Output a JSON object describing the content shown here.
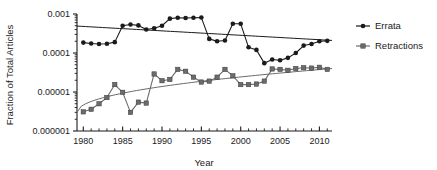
{
  "chart_data": {
    "type": "line",
    "title": "",
    "xlabel": "Year",
    "ylabel": "Fraction of Total Articles",
    "yscale": "log",
    "xlim": [
      1979.2,
      2011.6
    ],
    "ylim": [
      1e-06,
      0.001
    ],
    "grid": false,
    "legend_position": "right",
    "xticks": [
      1980,
      1985,
      1990,
      1995,
      2000,
      2005,
      2010
    ],
    "xtick_labels": [
      "1980",
      "1985",
      "1990",
      "1995",
      "2000",
      "2005",
      "2010"
    ],
    "xminor_tick_step": 1,
    "yticks": [
      0.001,
      0.0001,
      1e-05,
      1e-06
    ],
    "ytick_labels": [
      "0.001",
      "0.0001",
      "0.00001",
      "0.000001"
    ],
    "x": [
      1980,
      1981,
      1982,
      1983,
      1984,
      1985,
      1986,
      1987,
      1988,
      1989,
      1990,
      1991,
      1992,
      1993,
      1994,
      1995,
      1996,
      1997,
      1998,
      1999,
      2000,
      2001,
      2002,
      2003,
      2004,
      2005,
      2006,
      2007,
      2008,
      2009,
      2010,
      2011
    ],
    "series": [
      {
        "name": "Errata",
        "color": "#1a1a1a",
        "marker": "circle",
        "values": [
          0.000185,
          0.000175,
          0.00017,
          0.000172,
          0.00019,
          0.0005,
          0.00054,
          0.00051,
          0.0004,
          0.00043,
          0.0005,
          0.00076,
          0.0008,
          0.00079,
          0.0008,
          0.00081,
          0.00023,
          0.0002,
          0.00021,
          0.00056,
          0.00056,
          0.00014,
          0.00012,
          5.5e-05,
          6.8e-05,
          6.5e-05,
          7.5e-05,
          0.0001,
          0.000155,
          0.00017,
          0.0002,
          0.000205
        ],
        "trendline": {
          "type": "linear-on-log",
          "y_start": 0.00049,
          "y_end": 0.00021
        }
      },
      {
        "name": "Retractions",
        "color": "#6b6b6b",
        "marker": "square",
        "values": [
          3.1e-06,
          3.6e-06,
          5e-06,
          7.2e-06,
          1.55e-05,
          9.8e-06,
          3e-06,
          5.5e-06,
          5.2e-06,
          2.9e-05,
          1.95e-05,
          2.1e-05,
          3.8e-05,
          3.4e-05,
          2.4e-05,
          1.8e-05,
          1.9e-05,
          2.4e-05,
          3.8e-05,
          2.6e-05,
          1.55e-05,
          1.55e-05,
          1.6e-05,
          1.9e-05,
          3.9e-05,
          3.8e-05,
          3.6e-05,
          4e-05,
          4.2e-05,
          4.1e-05,
          4.3e-05,
          3.8e-05
        ],
        "trendline": {
          "type": "power-curve",
          "y_start": 3e-06,
          "y_end": 4e-05
        }
      }
    ],
    "legend": [
      {
        "label": "Errata",
        "color": "#1a1a1a",
        "marker": "circle"
      },
      {
        "label": "Retractions",
        "color": "#6b6b6b",
        "marker": "square"
      }
    ]
  }
}
